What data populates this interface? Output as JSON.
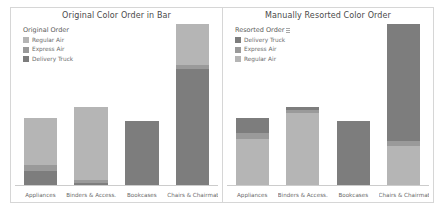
{
  "chart_data": [
    {
      "type": "bar",
      "title": "Original Color Order in Bar",
      "legend_title": "Original Order",
      "legend_position": "top-left",
      "stacked": true,
      "grid": false,
      "xlabel": "",
      "ylabel": "",
      "ylim": [
        0,
        100
      ],
      "categories": [
        "Appliances",
        "Binders & Access.",
        "Bookcases",
        "Chairs & Chairmats"
      ],
      "series": [
        {
          "name": "Regular Air",
          "color": "#b5b5b5",
          "values": [
            29,
            45,
            0,
            25
          ]
        },
        {
          "name": "Express Air",
          "color": "#9a9a9a",
          "values": [
            4,
            2,
            0,
            3
          ]
        },
        {
          "name": "Delivery Truck",
          "color": "#7d7d7d",
          "values": [
            9,
            2,
            40,
            72
          ]
        }
      ]
    },
    {
      "type": "bar",
      "title": "Manually Resorted Color Order",
      "legend_title": "Resorted Order",
      "legend_icon": "sort-icon",
      "legend_position": "top-left",
      "stacked": true,
      "grid": false,
      "xlabel": "",
      "ylabel": "",
      "ylim": [
        0,
        100
      ],
      "categories": [
        "Appliances",
        "Binders & Access.",
        "Bookcases",
        "Chairs & Chairmats"
      ],
      "series": [
        {
          "name": "Delivery Truck",
          "color": "#7d7d7d",
          "values": [
            9,
            2,
            40,
            72
          ]
        },
        {
          "name": "Express Air",
          "color": "#9a9a9a",
          "values": [
            4,
            2,
            0,
            3
          ]
        },
        {
          "name": "Regular Air",
          "color": "#b5b5b5",
          "values": [
            29,
            45,
            0,
            25
          ]
        }
      ]
    }
  ],
  "theme": {
    "background": "#ffffff",
    "border": "#d6d6d6",
    "title_color": "#4a4a4a",
    "label_color": "#6a6a6a",
    "axis_color": "#cccccc"
  }
}
